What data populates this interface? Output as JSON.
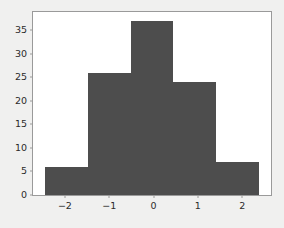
{
  "chart_data": {
    "type": "bar",
    "title": "",
    "subtitle": "",
    "xlabel": "",
    "ylabel": "",
    "grid": false,
    "legend": null,
    "legend_position": "none",
    "bar_color": "#4d4d4d",
    "plot_background": "#ffffff",
    "figure_background": "#f0f0ef",
    "axis_color": "#9a9a9a",
    "tick_label_color": "#2b2b2b",
    "xlim": [
      -2.72,
      2.65
    ],
    "ylim": [
      0,
      38.9
    ],
    "xticks": [
      "−2",
      "−1",
      "0",
      "1",
      "2"
    ],
    "xtick_values": [
      -2,
      -1,
      0,
      1,
      2
    ],
    "yticks": [
      "0",
      "5",
      "10",
      "15",
      "20",
      "25",
      "30",
      "35"
    ],
    "ytick_values": [
      0,
      5,
      10,
      15,
      20,
      25,
      30,
      35
    ],
    "bin_edges": [
      -2.45,
      -1.48,
      -0.52,
      0.45,
      1.41,
      2.38
    ],
    "categories": [
      "-2.45 to -1.48",
      "-1.48 to -0.52",
      "-0.52 to 0.45",
      "0.45 to 1.41",
      "1.41 to 2.38"
    ],
    "values": [
      6,
      26,
      37,
      24,
      7
    ],
    "bars": [
      {
        "label": "bin-1",
        "x0": -2.45,
        "x1": -1.48,
        "value": 6
      },
      {
        "label": "bin-2",
        "x0": -1.48,
        "x1": -0.52,
        "value": 26
      },
      {
        "label": "bin-3",
        "x0": -0.52,
        "x1": 0.45,
        "value": 37
      },
      {
        "label": "bin-4",
        "x0": 0.45,
        "x1": 1.41,
        "value": 24
      },
      {
        "label": "bin-5",
        "x0": 1.41,
        "x1": 2.38,
        "value": 7
      }
    ]
  }
}
